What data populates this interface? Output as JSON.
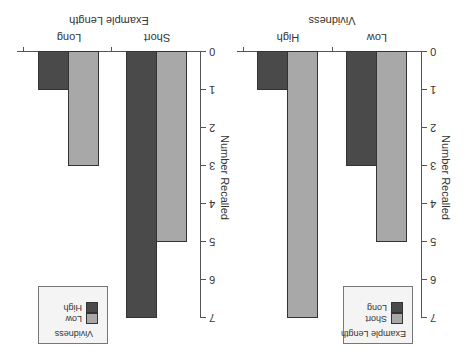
{
  "chart_data": [
    {
      "type": "bar",
      "title": "",
      "xlabel": "Vividness",
      "ylabel": "Number Recalled",
      "categories": [
        "Low",
        "High"
      ],
      "series": [
        {
          "name": "Short",
          "color": "#a8a8a8",
          "values": [
            5,
            7
          ]
        },
        {
          "name": "Long",
          "color": "#4a4a4a",
          "values": [
            3,
            1
          ]
        }
      ],
      "ylim": [
        0,
        7
      ],
      "yticks": [
        "0",
        "1",
        "2",
        "3",
        "4",
        "5",
        "6",
        "7"
      ],
      "grid": false,
      "legend": {
        "title": "Example Length",
        "entries": [
          "Short",
          "Long"
        ],
        "position": "upper-left"
      }
    },
    {
      "type": "bar",
      "title": "",
      "xlabel": "Example Length",
      "ylabel": "Number Recalled",
      "categories": [
        "Short",
        "Long"
      ],
      "series": [
        {
          "name": "Low",
          "color": "#a8a8a8",
          "values": [
            5,
            3
          ]
        },
        {
          "name": "High",
          "color": "#4a4a4a",
          "values": [
            7,
            1
          ]
        }
      ],
      "ylim": [
        0,
        7
      ],
      "yticks": [
        "0",
        "1",
        "2",
        "3",
        "4",
        "5",
        "6",
        "7"
      ],
      "grid": false,
      "legend": {
        "title": "Vividness",
        "entries": [
          "Low",
          "High"
        ],
        "position": "upper-right"
      }
    }
  ],
  "display": {
    "orientation": "rotated 180 degrees"
  },
  "panels": [
    {
      "xlabel": "Vividness",
      "ylabel": "Number Recalled",
      "categories": [
        "Low",
        "High"
      ],
      "legend_title": "Example Length",
      "legend_entries": [
        "Short",
        "Long"
      ],
      "yticks": [
        "0",
        "1",
        "2",
        "3",
        "4",
        "5",
        "6",
        "7"
      ]
    },
    {
      "xlabel": "Example Length",
      "ylabel": "Number Recalled",
      "categories": [
        "Short",
        "Long"
      ],
      "legend_title": "Vividness",
      "legend_entries": [
        "Low",
        "High"
      ],
      "yticks": [
        "0",
        "1",
        "2",
        "3",
        "4",
        "5",
        "6",
        "7"
      ]
    }
  ]
}
